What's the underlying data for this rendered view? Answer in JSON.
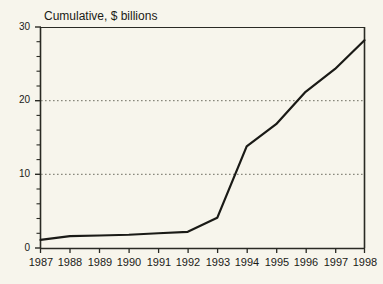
{
  "chart_data": {
    "type": "line",
    "title": "Cumulative, $ billions",
    "xlabel": "",
    "ylabel": "",
    "categories": [
      "1987",
      "1988",
      "1989",
      "1990",
      "1991",
      "1992",
      "1993",
      "1994",
      "1995",
      "1996",
      "1997",
      "1998"
    ],
    "x": [
      1987,
      1988,
      1989,
      1990,
      1991,
      1992,
      1993,
      1994,
      1995,
      1996,
      1997,
      1998
    ],
    "values": [
      1.1,
      1.6,
      1.7,
      1.8,
      2.0,
      2.2,
      4.1,
      13.8,
      16.8,
      21.2,
      24.3,
      28.2
    ],
    "series": [
      {
        "name": "Cumulative",
        "values": [
          1.1,
          1.6,
          1.7,
          1.8,
          2.0,
          2.2,
          4.1,
          13.8,
          16.8,
          21.2,
          24.3,
          28.2
        ]
      }
    ],
    "ylim": [
      0,
      30
    ],
    "xlim": [
      1987,
      1998
    ],
    "ytick_labels": [
      "0",
      "10",
      "20",
      "30"
    ],
    "ytick_values": [
      0,
      10,
      20,
      30
    ],
    "yminor_step": 2,
    "gridlines": [
      10,
      20
    ],
    "grid": "horizontal-dotted",
    "legend": "none",
    "line_color": "#1a1a16",
    "background_color": "#f7f5ec",
    "axis_color": "#3a3a32",
    "grid_color": "#8a8a7e"
  }
}
